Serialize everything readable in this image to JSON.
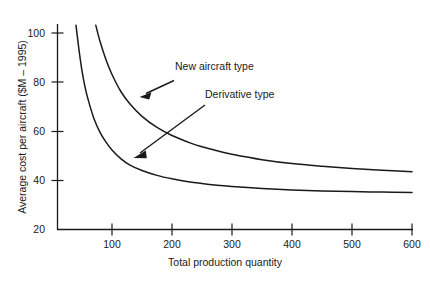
{
  "chart_data": {
    "type": "line",
    "title": "",
    "xlabel": "Total production quantity",
    "ylabel": "Average cost per aircraft ($M – 1995)",
    "xlim": [
      20,
      600
    ],
    "ylim": [
      20,
      108
    ],
    "grid": false,
    "legend_position": "inline-annotations",
    "xticks": [
      100,
      200,
      300,
      400,
      500,
      600
    ],
    "xticklabels": [
      "100",
      "200",
      "300",
      "400",
      "500",
      "600"
    ],
    "yticks": [
      20,
      40,
      60,
      80,
      100
    ],
    "yticklabels": [
      "20",
      "40",
      "60",
      "80",
      "100"
    ],
    "annotations": [
      {
        "label": "New aircraft type",
        "points_to_series": "New aircraft type",
        "target_x": 142,
        "target_y": 72
      },
      {
        "label": "Derivative type",
        "points_to_series": "Derivative type",
        "target_x": 133,
        "target_y": 47
      }
    ],
    "series": [
      {
        "name": "New aircraft type",
        "x": [
          73,
          80,
          90,
          100,
          115,
          130,
          150,
          175,
          200,
          230,
          250,
          275,
          300,
          350,
          400,
          450,
          500,
          550,
          600
        ],
        "values": [
          103.0,
          96.5,
          89.0,
          83.0,
          76.0,
          71.0,
          66.0,
          61.5,
          58.2,
          55.2,
          53.6,
          52.0,
          50.6,
          48.4,
          46.8,
          45.7,
          44.8,
          44.1,
          43.5
        ]
      },
      {
        "name": "Derivative type",
        "x": [
          40,
          45,
          50,
          55,
          60,
          70,
          80,
          90,
          100,
          115,
          130,
          150,
          175,
          200,
          230,
          250,
          275,
          300,
          350,
          400,
          450,
          500,
          550,
          600
        ],
        "values": [
          103.0,
          93.0,
          84.5,
          78.0,
          73.0,
          65.0,
          59.5,
          55.5,
          52.3,
          48.7,
          46.2,
          44.0,
          42.0,
          40.6,
          39.3,
          38.7,
          38.0,
          37.5,
          36.7,
          36.1,
          35.7,
          35.4,
          35.2,
          35.0
        ]
      }
    ]
  },
  "axis": {
    "y_title": "Average cost per aircraft ($M – 1995)",
    "x_title": "Total production quantity"
  }
}
